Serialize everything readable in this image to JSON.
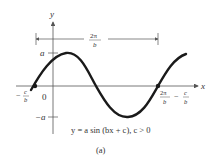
{
  "figure": {
    "caption": "(a)",
    "equation": "y = a sin (bx + c), c > 0",
    "axes": {
      "x_label": "x",
      "y_label": "y",
      "origin_label": "0"
    },
    "labels": {
      "amplitude_pos": "a",
      "amplitude_neg": "−a",
      "phase_start_num": "c",
      "phase_start_den": "b",
      "phase_start_sign": "−",
      "period_num": "2π",
      "period_den": "b",
      "end_num1": "2π",
      "end_den1": "b",
      "end_minus": "−",
      "end_num2": "c",
      "end_den2": "b"
    },
    "colors": {
      "curve": "#1a1a1a",
      "axis": "#555555",
      "text": "#333333"
    }
  }
}
